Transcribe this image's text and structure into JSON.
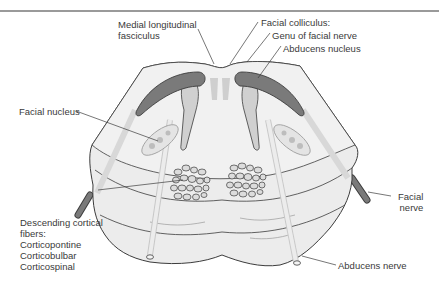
{
  "figure": {
    "colors": {
      "tissue_fill": "#ececec",
      "tissue_edge": "#3c3c3c",
      "nerve_tract": "#7a7a7a",
      "nerve_tract_light": "#d8d8d8",
      "nucleus_fill": "#c4c4c4",
      "fiber_bundle_fill": "#dcdcdc",
      "border_rule": "#9a9a9a",
      "label_text": "#3a3a3a"
    },
    "labels": {
      "mlf_line1": "Medial longitudinal",
      "mlf_line2": "fasciculus",
      "facial_colliculus": "Facial colliculus:",
      "genu": "Genu of facial nerve",
      "abducens_nucleus": "Abducens nucleus",
      "facial_nucleus": "Facial nucleus",
      "descending_line1": "Descending cortical",
      "descending_line2": "fibers:",
      "descending_line3": "Corticopontine",
      "descending_line4": "Corticobulbar",
      "descending_line5": "Corticospinal",
      "facial_nerve_line1": "Facial",
      "facial_nerve_line2": "nerve",
      "abducens_nerve": "Abducens nerve"
    }
  }
}
